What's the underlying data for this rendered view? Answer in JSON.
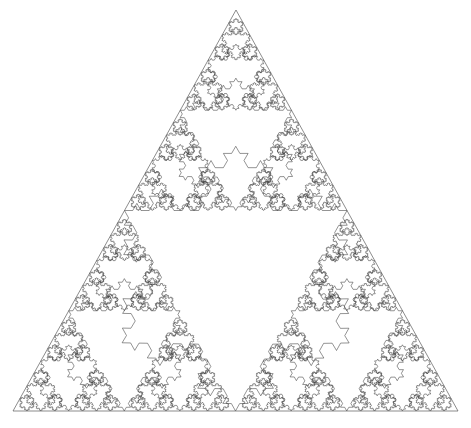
{
  "figure": {
    "type": "geometric-fractal",
    "canvas": {
      "width": 471,
      "height": 428
    },
    "background_color": "#ffffff"
  },
  "chart_data": {
    "type": "line",
    "subtitle": "",
    "xlabel": "",
    "ylabel": "",
    "grid": false,
    "legend": null,
    "axes_visible": false,
    "tick_labels_x": [],
    "tick_labels_y": [],
    "annotations": [],
    "construction": {
      "base_shape": "equilateral-triangle-outline",
      "removal_shape": "koch-snowflake",
      "sierpinski_depth": 5,
      "koch_iterations": 3,
      "snowflake_orientation": "inverted",
      "snowflake_scale_factor": 1.0
    },
    "outer_triangle": {
      "apex": {
        "x": 236,
        "y": 10
      },
      "bottom_left": {
        "x": 13,
        "y": 411
      },
      "bottom_right": {
        "x": 458,
        "y": 411
      },
      "side_length_px": 445,
      "height_px": 401
    },
    "style": {
      "stroke_color": "#3a3a3a",
      "outline_stroke_color": "#5a5a5a",
      "stroke_width": 0.55,
      "outline_stroke_width": 0.7,
      "fill": "none"
    },
    "snowflake_levels": [
      {
        "level": 1,
        "count": 1,
        "relative_side": 0.5,
        "approx_side_px": 222.5
      },
      {
        "level": 2,
        "count": 3,
        "relative_side": 0.25,
        "approx_side_px": 111.25
      },
      {
        "level": 3,
        "count": 9,
        "relative_side": 0.125,
        "approx_side_px": 55.6
      },
      {
        "level": 4,
        "count": 27,
        "relative_side": 0.0625,
        "approx_side_px": 27.8
      },
      {
        "level": 5,
        "count": 81,
        "relative_side": 0.03125,
        "approx_side_px": 13.9
      }
    ],
    "total_snowflakes": 121
  }
}
